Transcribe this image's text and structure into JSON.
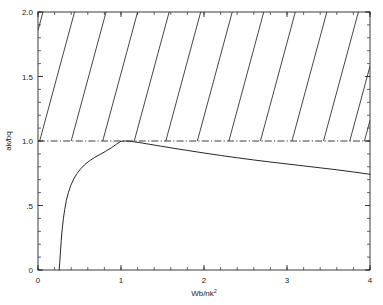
{
  "chart_data": {
    "type": "line",
    "title": "",
    "subtitle": "",
    "xlabel_main": "Wb/nk",
    "xlabel_sup": "2",
    "xlabel": "Wb/nk2",
    "ylabel": "ak/bq",
    "xlim": [
      0,
      4
    ],
    "ylim": [
      0,
      2.0
    ],
    "grid": false,
    "legend": null,
    "x_ticks": [
      {
        "value": 0,
        "label": "0"
      },
      {
        "value": 1,
        "label": "1"
      },
      {
        "value": 2,
        "label": "2"
      },
      {
        "value": 3,
        "label": "3"
      },
      {
        "value": 4,
        "label": "4"
      }
    ],
    "y_ticks": [
      {
        "value": 0,
        "label": "0"
      },
      {
        "value": 0.5,
        "label": ".5"
      },
      {
        "value": 1.0,
        "label": "1.0"
      },
      {
        "value": 1.5,
        "label": "1.5"
      },
      {
        "value": 2.0,
        "label": "2.0"
      }
    ],
    "x_minor_step": 0.2,
    "y_minor_step": 0.1,
    "series": [
      {
        "name": "stability-boundary",
        "style": "solid",
        "points": [
          [
            0.255,
            0.0
          ],
          [
            0.262,
            0.06
          ],
          [
            0.27,
            0.14
          ],
          [
            0.28,
            0.23
          ],
          [
            0.292,
            0.32
          ],
          [
            0.306,
            0.4
          ],
          [
            0.322,
            0.47
          ],
          [
            0.342,
            0.54
          ],
          [
            0.366,
            0.6
          ],
          [
            0.395,
            0.655
          ],
          [
            0.43,
            0.705
          ],
          [
            0.47,
            0.748
          ],
          [
            0.515,
            0.785
          ],
          [
            0.565,
            0.818
          ],
          [
            0.62,
            0.846
          ],
          [
            0.68,
            0.872
          ],
          [
            0.745,
            0.895
          ],
          [
            0.815,
            0.92
          ],
          [
            0.89,
            0.95
          ],
          [
            0.95,
            0.978
          ],
          [
            1.0,
            0.998
          ],
          [
            1.06,
            1.0
          ],
          [
            1.13,
            0.996
          ],
          [
            1.22,
            0.988
          ],
          [
            1.34,
            0.975
          ],
          [
            1.48,
            0.96
          ],
          [
            1.64,
            0.943
          ],
          [
            1.82,
            0.925
          ],
          [
            2.0,
            0.907
          ],
          [
            2.2,
            0.888
          ],
          [
            2.4,
            0.87
          ],
          [
            2.6,
            0.853
          ],
          [
            2.8,
            0.837
          ],
          [
            3.0,
            0.822
          ],
          [
            3.2,
            0.807
          ],
          [
            3.4,
            0.792
          ],
          [
            3.6,
            0.777
          ],
          [
            3.8,
            0.76
          ],
          [
            4.0,
            0.742
          ]
        ]
      },
      {
        "name": "unity-threshold",
        "style": "dash-dot",
        "value": 1.0,
        "points": [
          [
            0,
            1.0
          ],
          [
            4,
            1.0
          ]
        ]
      }
    ],
    "hatching": {
      "description": "unstable-region-hatch",
      "slope_dx_per_dy": 0.42,
      "count": 12,
      "top_x_positions": [
        0.06,
        0.44,
        0.82,
        1.2,
        1.58,
        1.96,
        2.34,
        2.72,
        3.1,
        3.48,
        3.86
      ],
      "region": "above-boundary-curve"
    },
    "colors": {
      "axis": "#262626",
      "curve": "#262626",
      "threshold": "#262626",
      "hatch": "#262626",
      "background": "#ffffff"
    }
  }
}
